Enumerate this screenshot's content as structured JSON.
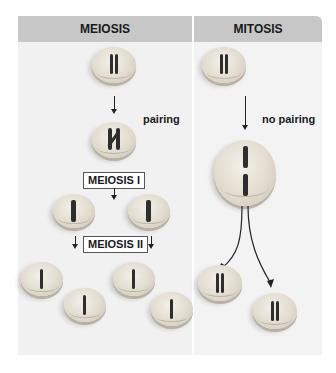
{
  "meiosis": {
    "title": "MEIOSIS",
    "pairing_label": "pairing",
    "stage1_label": "MEIOSIS I",
    "stage2_label": "MEIOSIS II",
    "cells": [
      {
        "id": "parent",
        "cx": 114,
        "cy": 66,
        "chromosomes": "two homologs"
      },
      {
        "id": "paired",
        "cx": 114,
        "cy": 140,
        "chromosomes": "paired homologs (tetrad)"
      },
      {
        "id": "mi-daughter-1",
        "cx": 74,
        "cy": 212,
        "chromosomes": "one duplicated chromosome"
      },
      {
        "id": "mi-daughter-2",
        "cx": 150,
        "cy": 212,
        "chromosomes": "one duplicated chromosome"
      },
      {
        "id": "mii-cell-1",
        "cx": 42,
        "cy": 280,
        "chromosomes": "one chromatid"
      },
      {
        "id": "mii-cell-2",
        "cx": 86,
        "cy": 304,
        "chromosomes": "one chromatid"
      },
      {
        "id": "mii-cell-3",
        "cx": 134,
        "cy": 280,
        "chromosomes": "one chromatid"
      },
      {
        "id": "mii-cell-4",
        "cx": 172,
        "cy": 310,
        "chromosomes": "one chromatid"
      }
    ]
  },
  "mitosis": {
    "title": "MITOSIS",
    "pairing_label": "no pairing",
    "cells": [
      {
        "id": "parent",
        "cx": 224,
        "cy": 66,
        "chromosomes": "two homologs"
      },
      {
        "id": "dividing",
        "cx": 244,
        "cy": 176,
        "chromosomes": "two duplicated chromosomes aligned"
      },
      {
        "id": "daughter-1",
        "cx": 220,
        "cy": 283,
        "chromosomes": "two homologs"
      },
      {
        "id": "daughter-2",
        "cx": 275,
        "cy": 311,
        "chromosomes": "two homologs"
      }
    ]
  },
  "colors": {
    "header_bg": "#c7c7c7",
    "panel_bg": "#f1f1f1",
    "chromosome": "#2e2e2e"
  }
}
